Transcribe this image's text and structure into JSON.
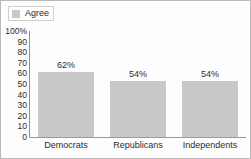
{
  "chart_data": {
    "type": "bar",
    "title": "",
    "xlabel": "",
    "ylabel": "",
    "categories": [
      "Democrats",
      "Republicans",
      "Independents"
    ],
    "values": [
      62,
      54,
      54
    ],
    "value_labels": [
      "62%",
      "54%",
      "54%"
    ],
    "series": [
      {
        "name": "Agree",
        "values": [
          62,
          54,
          54
        ],
        "color": "#c9c9c9"
      }
    ],
    "ylim": [
      0,
      100
    ],
    "ytick_labels": [
      "100%",
      "90",
      "80",
      "70",
      "60",
      "50",
      "40",
      "30",
      "20",
      "10",
      "0"
    ],
    "ytick_values": [
      100,
      90,
      80,
      70,
      60,
      50,
      40,
      30,
      20,
      10,
      0
    ],
    "grid": false,
    "legend_position": "top-left"
  },
  "legend": {
    "items": [
      {
        "label": "Agree",
        "color": "#c9c9c9"
      }
    ]
  },
  "colors": {
    "bar": "#c9c9c9",
    "axis": "#8f8f8f",
    "text": "#2b2b2b",
    "frame": "#b9b9b9",
    "background": "#fdfdfd"
  }
}
